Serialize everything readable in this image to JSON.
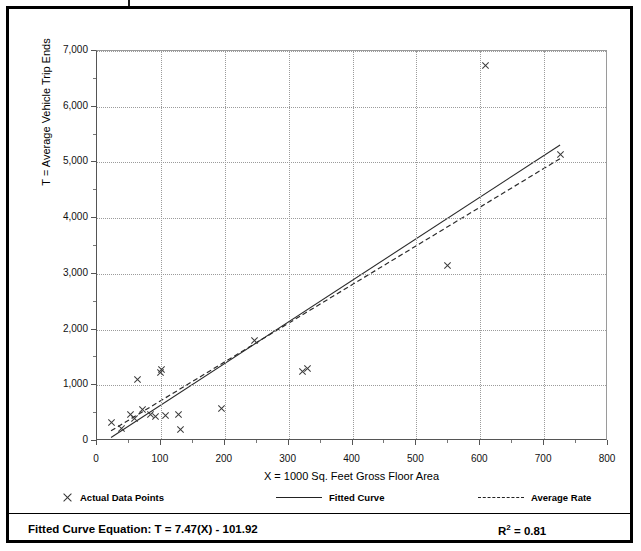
{
  "chart_data": {
    "type": "scatter",
    "title": "",
    "xlabel": "X = 1000 Sq. Feet Gross Floor Area",
    "ylabel": "T = Average Vehicle Trip Ends",
    "xlim": [
      0,
      800
    ],
    "ylim": [
      0,
      7000
    ],
    "xticks": [
      0,
      100,
      200,
      300,
      400,
      500,
      600,
      700,
      800
    ],
    "xtick_labels": [
      "0",
      "100",
      "200",
      "300",
      "400",
      "500",
      "600",
      "700",
      "800"
    ],
    "yticks": [
      0,
      1000,
      2000,
      3000,
      4000,
      5000,
      6000,
      7000
    ],
    "ytick_labels": [
      "0",
      "1,000",
      "2,000",
      "3,000",
      "4,000",
      "5,000",
      "6,000",
      "7,000"
    ],
    "xtick_minor_step": 50,
    "ytick_minor_step": 500,
    "grid": true,
    "grid_style": "dotted",
    "legend_position": "bottom",
    "series": [
      {
        "name": "Actual Data Points",
        "type": "scatter",
        "marker": "x",
        "color": "#3a3a3a",
        "points": [
          {
            "x": 22,
            "y": 340
          },
          {
            "x": 38,
            "y": 230
          },
          {
            "x": 52,
            "y": 480
          },
          {
            "x": 58,
            "y": 400
          },
          {
            "x": 64,
            "y": 1110
          },
          {
            "x": 72,
            "y": 560
          },
          {
            "x": 84,
            "y": 470
          },
          {
            "x": 92,
            "y": 440
          },
          {
            "x": 99,
            "y": 1230
          },
          {
            "x": 101,
            "y": 1280
          },
          {
            "x": 108,
            "y": 450
          },
          {
            "x": 127,
            "y": 480
          },
          {
            "x": 130,
            "y": 210
          },
          {
            "x": 195,
            "y": 575
          },
          {
            "x": 247,
            "y": 1800
          },
          {
            "x": 322,
            "y": 1240
          },
          {
            "x": 330,
            "y": 1300
          },
          {
            "x": 549,
            "y": 3150
          },
          {
            "x": 608,
            "y": 6740
          },
          {
            "x": 725,
            "y": 5140
          }
        ]
      },
      {
        "name": "Fitted Curve",
        "type": "line",
        "style": "solid",
        "color": "#2b2b2b",
        "equation": "T = 7.47(X) - 101.92",
        "slope": 7.47,
        "intercept": -101.92,
        "x_range": [
          22,
          725
        ]
      },
      {
        "name": "Average Rate",
        "type": "line",
        "style": "dashed",
        "color": "#2b2b2b",
        "slope": 6.95,
        "intercept": 30,
        "x_range": [
          22,
          725
        ]
      }
    ]
  },
  "legend": {
    "items": [
      {
        "label": "Actual Data Points",
        "marker": "x-marker"
      },
      {
        "label": "Fitted Curve",
        "marker": "solid-line"
      },
      {
        "label": "Average Rate",
        "marker": "dashed-line"
      }
    ]
  },
  "footer": {
    "equation_label": "Fitted Curve Equation:",
    "equation_value": "T = 7.47(X) - 101.92",
    "equation_full": "Fitted Curve Equation:  T = 7.47(X) - 101.92",
    "r_squared_base": "R",
    "r_squared_exponent": "2",
    "r_squared_value": "= 0.81",
    "r_squared_full": "R2 = 0.81"
  },
  "colors": {
    "axis": "#555555",
    "grid": "#9b9b9b",
    "marker": "#3a3a3a",
    "line": "#2b2b2b",
    "frame": "#000000",
    "background": "#ffffff"
  }
}
